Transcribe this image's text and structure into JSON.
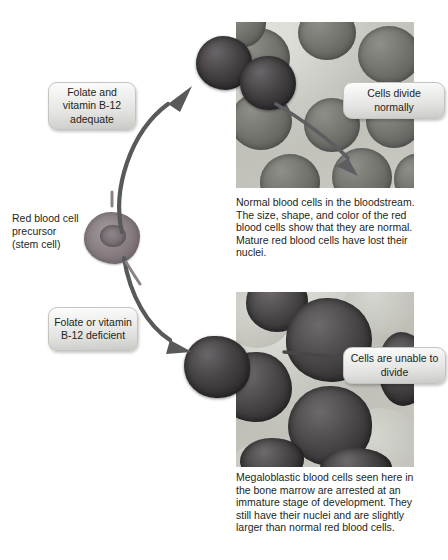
{
  "diagram": {
    "title_visible": false,
    "accent_colors": {
      "text": "#231f20",
      "arrow": "#58595b",
      "box_fill_top": "#fdfdfd",
      "box_fill_bottom": "#c9c9c6",
      "photo_background": "#c4c4bd",
      "red_blood_cell": "#757570",
      "megaloblast": "#3a3638",
      "stem_cell": "#8d8387"
    }
  },
  "labels": {
    "precursor": "Red blood cell\nprecursor\n(stem cell)",
    "adequate": "Folate and\nvitamin B-12\nadequate",
    "deficient": "Folate or\nvitamin B-12\ndeficient",
    "divide_normally": "Cells divide\nnormally",
    "unable_to_divide": "Cells are unable\nto divide"
  },
  "captions": {
    "normal": "Normal blood cells in the bloodstream. The size, shape, and color of the red blood cells show that they are normal. Mature red blood cells have lost their nuclei.",
    "megaloblastic": "Megaloblastic blood cells seen here in the bone marrow are arrested at an immature stage of development. They still have their nuclei and are slightly larger than normal red blood cells."
  },
  "panels": [
    {
      "name": "normal-blood-cells-micrograph",
      "callout": "Cells divide normally",
      "pathway": "adequate",
      "arrow_direction": "up-right"
    },
    {
      "name": "megaloblastic-blood-cells-micrograph",
      "callout": "Cells are unable to divide",
      "pathway": "deficient",
      "arrow_direction": "down-right"
    }
  ],
  "icons": {
    "upper_pathway_arrow": "curved-arrow-up-right-icon",
    "lower_pathway_arrow": "curved-arrow-down-right-icon",
    "divide_pointer_arrow": "curved-arrow-down-right-icon",
    "unable_pointer_line": "straight-leader-line-icon"
  }
}
